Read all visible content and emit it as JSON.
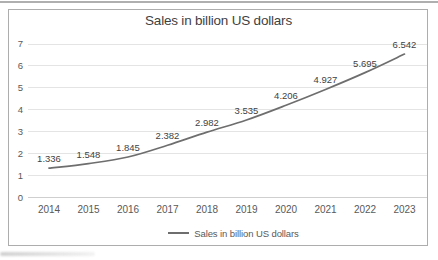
{
  "chart_data": {
    "type": "line",
    "title": "Sales in billion US dollars",
    "categories": [
      "2014",
      "2015",
      "2016",
      "2017",
      "2018",
      "2019",
      "2020",
      "2021",
      "2022",
      "2023"
    ],
    "series": [
      {
        "name": "Sales in billion US dollars",
        "values": [
          1.336,
          1.548,
          1.845,
          2.382,
          2.982,
          3.535,
          4.206,
          4.927,
          5.695,
          6.542
        ],
        "color": "#6e6e6e"
      }
    ],
    "data_labels": [
      "1.336",
      "1.548",
      "1.845",
      "2.382",
      "2.982",
      "3.535",
      "4.206",
      "4.927",
      "5.695",
      "6.542"
    ],
    "xlabel": "",
    "ylabel": "",
    "ylim": [
      0,
      7
    ],
    "ytick_step": 1,
    "yticks": [
      "0",
      "1",
      "2",
      "3",
      "4",
      "5",
      "6",
      "7"
    ],
    "grid": true,
    "smoothed_line": true,
    "legend_position": "bottom"
  },
  "colors": {
    "line": "#6e6e6e",
    "grid": "#e4e4e4",
    "axis": "#cfcfcf",
    "tick_label": "#595959",
    "data_label": "#3f3f3f",
    "title": "#3f3f3f",
    "legend_text": "#595959",
    "frame_border": "#adadad"
  }
}
